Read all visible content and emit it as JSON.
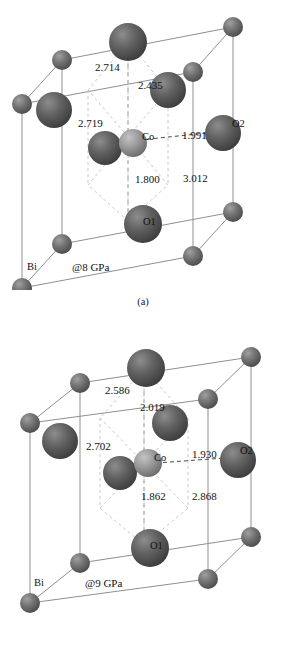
{
  "panels": [
    {
      "id": "a",
      "caption": "(a)",
      "pressure_label": "@8 GPa",
      "atom_labels": {
        "bi": "Bi",
        "co": "Co",
        "o1": "O1",
        "o2": "O2"
      },
      "distances": {
        "top_left": "2.714",
        "upper_mid": "2.435",
        "mid_left": "2.719",
        "right": "1.991",
        "center_down": "1.800",
        "lower_right": "3.012"
      }
    },
    {
      "id": "b",
      "caption": "(b)",
      "pressure_label": "@9 GPa",
      "atom_labels": {
        "bi": "Bi",
        "co": "Co",
        "o1": "O1",
        "o2": "O2"
      },
      "distances": {
        "top_left": "2.586",
        "upper_mid": "2.019",
        "mid_left": "2.702",
        "right": "1.930",
        "center_down": "1.862",
        "lower_right": "2.868"
      }
    }
  ],
  "colors": {
    "cell_edge": "#8a8a8a",
    "dashed_bond": "#bdbdbd",
    "sphere_dark": "#5a5a5a",
    "sphere_mid": "#6f6f6f",
    "sphere_light": "#9a9a9a",
    "background": "#ffffff",
    "text": "#111111"
  }
}
